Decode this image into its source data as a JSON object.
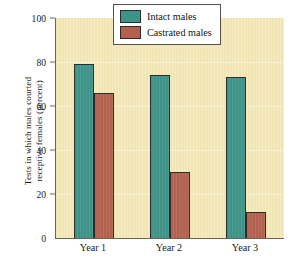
{
  "chart_data": {
    "type": "bar",
    "title": "",
    "subtitle": "",
    "xlabel": "",
    "ylabel": "Tests in which males courted\nreceptive females (percent)",
    "categories": [
      "Year 1",
      "Year 2",
      "Year 3"
    ],
    "series": [
      {
        "name": "Intact males",
        "color": "#3f9287",
        "values": [
          79,
          74,
          73
        ]
      },
      {
        "name": "Castrated males",
        "color": "#b3614f",
        "values": [
          66,
          30,
          12
        ]
      }
    ],
    "ylim": [
      0,
      100
    ],
    "yticks": [
      0,
      20,
      40,
      60,
      80,
      100
    ],
    "ytick_labels": [
      "0",
      "20",
      "40",
      "60",
      "80",
      "100"
    ],
    "grid": "horizontal-faint",
    "legend_position": "upper-right-inside",
    "plot_background": "#f2e5b4",
    "axis_color": "#6b6456",
    "bar_outline_color": "#2c2c2c"
  },
  "legend": {
    "items": [
      {
        "label": "Intact males",
        "color": "#3f9287"
      },
      {
        "label": "Castrated males",
        "color": "#b3614f"
      }
    ]
  },
  "axes": {
    "y_title": "Tests in which males courted\nreceptive females (percent)",
    "y_tick_labels": [
      "100",
      "80",
      "60",
      "40",
      "20",
      "0"
    ],
    "x_tick_labels": [
      "Year 1",
      "Year 2",
      "Year 3"
    ]
  }
}
